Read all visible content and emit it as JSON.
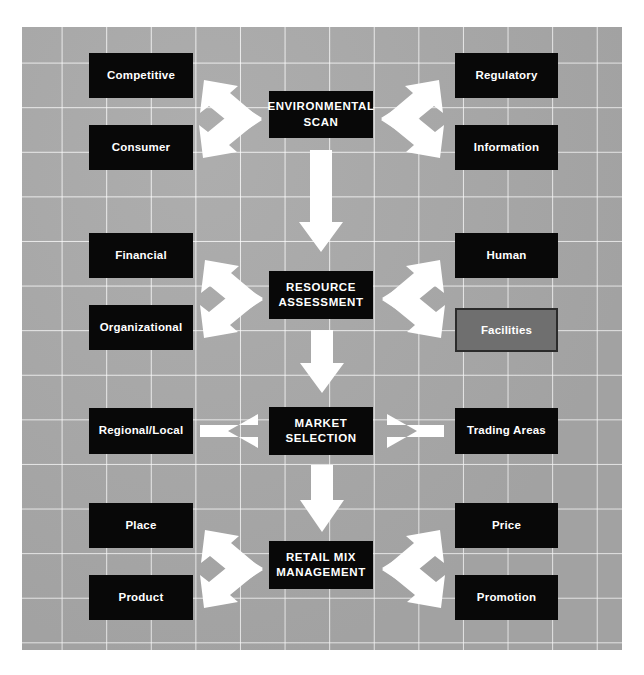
{
  "diagram": {
    "background_color": "#a9a9a9",
    "grid_line_color": "#ffffff",
    "box_color": "#080808",
    "box_text_color": "#ffffff",
    "highlight_color": "#6f6f6f",
    "highlight_border_color": "#2b2b2b",
    "arrow_color": "#ffffff"
  },
  "stages": [
    {
      "id": "environmental-scan",
      "label": "ENVIRONMENTAL\nSCAN",
      "line1": "ENVIRONMENTAL",
      "line2": "SCAN",
      "left_items": [
        "Competitive",
        "Consumer"
      ],
      "right_items": [
        "Regulatory",
        "Information"
      ],
      "connector": "fan"
    },
    {
      "id": "resource-assessment",
      "label": "RESOURCE\nASSESSMENT",
      "line1": "RESOURCE",
      "line2": "ASSESSMENT",
      "left_items": [
        "Financial",
        "Organizational"
      ],
      "right_items": [
        "Human",
        "Facilities"
      ],
      "connector": "fan"
    },
    {
      "id": "market-selection",
      "label": "MARKET\nSELECTION",
      "line1": "MARKET",
      "line2": "SELECTION",
      "left_items": [
        "Regional/Local"
      ],
      "right_items": [
        "Trading Areas"
      ],
      "connector": "straight"
    },
    {
      "id": "retail-mix-management",
      "label": "RETAIL MIX\nMANAGEMENT",
      "line1": "RETAIL MIX",
      "line2": "MANAGEMENT",
      "left_items": [
        "Place",
        "Product"
      ],
      "right_items": [
        "Price",
        "Promotion"
      ],
      "connector": "fan"
    }
  ],
  "nodes": {
    "competitive": "Competitive",
    "consumer": "Consumer",
    "regulatory": "Regulatory",
    "information": "Information",
    "financial": "Financial",
    "organizational": "Organizational",
    "human": "Human",
    "facilities": "Facilities",
    "regional_local": "Regional/Local",
    "trading_areas": "Trading Areas",
    "place": "Place",
    "product": "Product",
    "price": "Price",
    "promotion": "Promotion"
  },
  "stage_labels": {
    "env_l1": "ENVIRONMENTAL",
    "env_l2": "SCAN",
    "res_l1": "RESOURCE",
    "res_l2": "ASSESSMENT",
    "mkt_l1": "MARKET",
    "mkt_l2": "SELECTION",
    "mix_l1": "RETAIL MIX",
    "mix_l2": "MANAGEMENT"
  },
  "highlighted_node": "Facilities"
}
